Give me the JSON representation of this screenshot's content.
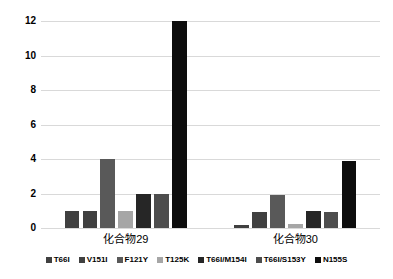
{
  "chart_data": {
    "type": "bar",
    "title": "",
    "xlabel": "",
    "ylabel": "",
    "ylim": [
      0,
      12
    ],
    "ytick_step": 2,
    "ytick_labels": [
      "0",
      "2",
      "4",
      "6",
      "8",
      "10",
      "12"
    ],
    "grid": true,
    "legend_position": "bottom",
    "categories": [
      "化合物29",
      "化合物30"
    ],
    "series": [
      {
        "name": "T66I",
        "color": "#404040",
        "values": [
          1.0,
          0.2
        ]
      },
      {
        "name": "V151I",
        "color": "#404040",
        "values": [
          1.0,
          0.9
        ]
      },
      {
        "name": "F121Y",
        "color": "#595959",
        "values": [
          4.0,
          1.9
        ]
      },
      {
        "name": "T125K",
        "color": "#a6a6a6",
        "values": [
          1.0,
          0.25
        ]
      },
      {
        "name": "T66I/M154I",
        "color": "#262626",
        "values": [
          2.0,
          1.0
        ]
      },
      {
        "name": "T66I/S153Y",
        "color": "#4d4d4d",
        "values": [
          2.0,
          0.9
        ]
      },
      {
        "name": "N155S",
        "color": "#0d0d0d",
        "values": [
          12.0,
          3.9
        ]
      }
    ]
  },
  "colors": {
    "gridline": "#d9d9d9",
    "background": "#ffffff",
    "text": "#000000"
  }
}
